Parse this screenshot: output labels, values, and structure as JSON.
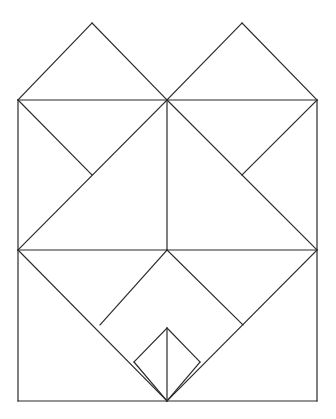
{
  "document": {
    "title": "Geometric Line Diagram",
    "type": "line-drawing",
    "width": 336,
    "height": 419,
    "background_color": "#ffffff"
  },
  "figure": {
    "name": "symmetric-tangram-crease-pattern",
    "stroke_color": "#2b2b2b",
    "stroke_width": 1.2,
    "fill": "none",
    "axis_of_symmetry_x": 167,
    "points": {
      "outer_top_left": [
        18,
        100
      ],
      "outer_top_right": [
        317,
        100
      ],
      "outer_mid_left": [
        18,
        250
      ],
      "outer_mid_right": [
        317,
        250
      ],
      "outer_bottom_left": [
        18,
        401
      ],
      "outer_bottom_right": [
        317,
        401
      ],
      "center_top": [
        167,
        100
      ],
      "center_mid": [
        167,
        250
      ],
      "center_bottom": [
        167,
        401
      ],
      "apex_left": [
        92,
        23
      ],
      "apex_right": [
        242,
        23
      ],
      "notch_upper_left": [
        92,
        175
      ],
      "notch_upper_right": [
        242,
        175
      ],
      "notch_lower_left": [
        100,
        325
      ],
      "notch_lower_right": [
        243,
        325
      ],
      "small_diamond_top": [
        167,
        328
      ],
      "small_diamond_left": [
        134,
        362
      ],
      "small_diamond_right": [
        200,
        362
      ],
      "small_diamond_bottom": [
        167,
        401
      ]
    },
    "segments": [
      {
        "name": "outer-left-edge",
        "from": [
          18,
          100
        ],
        "to": [
          18,
          401
        ]
      },
      {
        "name": "outer-right-edge",
        "from": [
          317,
          100
        ],
        "to": [
          317,
          401
        ]
      },
      {
        "name": "outer-bottom-edge",
        "from": [
          18,
          401
        ],
        "to": [
          317,
          401
        ]
      },
      {
        "name": "top-horizontal-left",
        "from": [
          18,
          100
        ],
        "to": [
          167,
          100
        ]
      },
      {
        "name": "top-horizontal-right",
        "from": [
          167,
          100
        ],
        "to": [
          317,
          100
        ]
      },
      {
        "name": "middle-horizontal-left",
        "from": [
          18,
          250
        ],
        "to": [
          167,
          250
        ]
      },
      {
        "name": "middle-horizontal-right",
        "from": [
          167,
          250
        ],
        "to": [
          317,
          250
        ]
      },
      {
        "name": "center-vertical-upper",
        "from": [
          167,
          100
        ],
        "to": [
          167,
          250
        ]
      },
      {
        "name": "center-vertical-lower",
        "from": [
          167,
          328
        ],
        "to": [
          167,
          401
        ]
      },
      {
        "name": "left-flap-up-left",
        "from": [
          18,
          100
        ],
        "to": [
          92,
          23
        ]
      },
      {
        "name": "left-flap-up-right",
        "from": [
          92,
          23
        ],
        "to": [
          167,
          100
        ]
      },
      {
        "name": "right-flap-up-left",
        "from": [
          167,
          100
        ],
        "to": [
          242,
          23
        ]
      },
      {
        "name": "right-flap-up-right",
        "from": [
          242,
          23
        ],
        "to": [
          317,
          100
        ]
      },
      {
        "name": "upper-left-short-diagonal",
        "from": [
          18,
          100
        ],
        "to": [
          92,
          175
        ]
      },
      {
        "name": "upper-left-long-diagonal",
        "from": [
          167,
          100
        ],
        "to": [
          18,
          250
        ]
      },
      {
        "name": "upper-right-short-diagonal",
        "from": [
          317,
          100
        ],
        "to": [
          242,
          175
        ]
      },
      {
        "name": "upper-right-long-diagonal",
        "from": [
          167,
          100
        ],
        "to": [
          317,
          250
        ]
      },
      {
        "name": "lower-left-long-diagonal",
        "from": [
          18,
          250
        ],
        "to": [
          167,
          401
        ]
      },
      {
        "name": "lower-left-short-diagonal",
        "from": [
          167,
          250
        ],
        "to": [
          100,
          325
        ]
      },
      {
        "name": "lower-right-long-diagonal",
        "from": [
          317,
          250
        ],
        "to": [
          167,
          401
        ]
      },
      {
        "name": "lower-right-short-diagonal",
        "from": [
          167,
          250
        ],
        "to": [
          243,
          325
        ]
      },
      {
        "name": "small-diamond-upper-left",
        "from": [
          167,
          328
        ],
        "to": [
          134,
          362
        ]
      },
      {
        "name": "small-diamond-lower-left",
        "from": [
          134,
          362
        ],
        "to": [
          167,
          401
        ]
      },
      {
        "name": "small-diamond-upper-right",
        "from": [
          167,
          328
        ],
        "to": [
          200,
          362
        ]
      },
      {
        "name": "small-diamond-lower-right",
        "from": [
          200,
          362
        ],
        "to": [
          167,
          401
        ]
      }
    ]
  }
}
